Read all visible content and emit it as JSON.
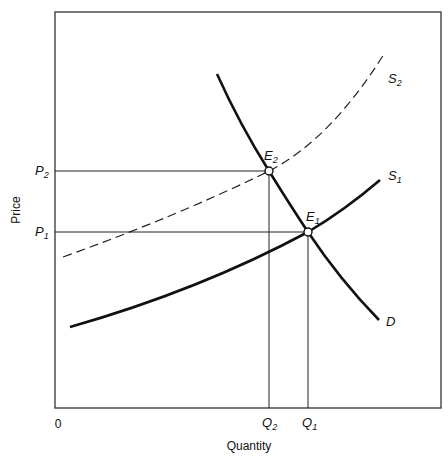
{
  "diagram": {
    "type": "supply-demand",
    "axes": {
      "xlabel": "Quantity",
      "ylabel": "Price",
      "origin": "0"
    },
    "price_levels": [
      {
        "label": "P",
        "sub": "2"
      },
      {
        "label": "P",
        "sub": "1"
      }
    ],
    "quantity_levels": [
      {
        "label": "Q",
        "sub": "2"
      },
      {
        "label": "Q",
        "sub": "1"
      }
    ],
    "curves": [
      {
        "label": "S",
        "sub": "2",
        "style": "dashed"
      },
      {
        "label": "S",
        "sub": "1",
        "style": "solid"
      },
      {
        "label": "D",
        "sub": "",
        "style": "solid"
      }
    ],
    "equilibria": [
      {
        "label": "E",
        "sub": "2"
      },
      {
        "label": "E",
        "sub": "1"
      }
    ],
    "colors": {
      "line": "#111111",
      "frame": "#333333",
      "background": "#ffffff"
    }
  }
}
